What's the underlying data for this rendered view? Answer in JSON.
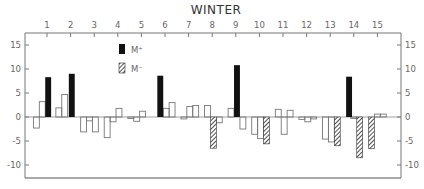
{
  "chart_data": {
    "type": "bar",
    "title": "WINTER",
    "xlabel": "",
    "ylabel": "",
    "x_ticks": [
      1,
      2,
      3,
      4,
      5,
      6,
      7,
      8,
      9,
      10,
      11,
      12,
      13,
      14,
      15
    ],
    "y_ticks": [
      15,
      10,
      5,
      0,
      -5,
      -10
    ],
    "xlim": [
      0.1,
      16.0
    ],
    "ylim": [
      -12.5,
      17.5
    ],
    "grid": false,
    "legend": {
      "position": "upper-center",
      "entries": [
        {
          "label": "M⁺",
          "style": "solid-black"
        },
        {
          "label": "M⁻",
          "style": "hatched"
        }
      ]
    },
    "series": [
      {
        "name": "open",
        "style": "outline",
        "bars": [
          {
            "x": 0.55,
            "y": -2.3
          },
          {
            "x": 0.8,
            "y": 3.2
          },
          {
            "x": 1.5,
            "y": 1.9
          },
          {
            "x": 1.75,
            "y": 4.7
          },
          {
            "x": 2.55,
            "y": -3.1
          },
          {
            "x": 2.8,
            "y": -0.8
          },
          {
            "x": 3.05,
            "y": -3.1
          },
          {
            "x": 3.55,
            "y": -4.3
          },
          {
            "x": 3.8,
            "y": -1.0
          },
          {
            "x": 4.05,
            "y": 1.8
          },
          {
            "x": 4.55,
            "y": -0.3
          },
          {
            "x": 4.8,
            "y": -0.9
          },
          {
            "x": 5.05,
            "y": 1.2
          },
          {
            "x": 6.05,
            "y": 1.8
          },
          {
            "x": 6.3,
            "y": 3.0
          },
          {
            "x": 6.8,
            "y": -0.4
          },
          {
            "x": 7.05,
            "y": 2.2
          },
          {
            "x": 7.3,
            "y": 2.4
          },
          {
            "x": 7.8,
            "y": 2.4
          },
          {
            "x": 8.3,
            "y": -1.2
          },
          {
            "x": 8.8,
            "y": 1.8
          },
          {
            "x": 9.3,
            "y": -2.5
          },
          {
            "x": 9.8,
            "y": -3.6
          },
          {
            "x": 10.05,
            "y": -4.5
          },
          {
            "x": 10.8,
            "y": 1.6
          },
          {
            "x": 11.05,
            "y": -3.6
          },
          {
            "x": 11.3,
            "y": 1.4
          },
          {
            "x": 11.8,
            "y": -0.5
          },
          {
            "x": 12.05,
            "y": -1.0
          },
          {
            "x": 12.3,
            "y": -0.4
          },
          {
            "x": 12.8,
            "y": -4.6
          },
          {
            "x": 13.05,
            "y": -5.2
          },
          {
            "x": 14.0,
            "y": -0.3
          },
          {
            "x": 15.0,
            "y": 0.6
          },
          {
            "x": 15.25,
            "y": 0.6
          }
        ]
      },
      {
        "name": "M+",
        "style": "solid-black",
        "bars": [
          {
            "x": 1.05,
            "y": 8.3
          },
          {
            "x": 2.05,
            "y": 9.0
          },
          {
            "x": 5.8,
            "y": 8.6
          },
          {
            "x": 9.05,
            "y": 10.8
          },
          {
            "x": 13.8,
            "y": 8.4
          }
        ]
      },
      {
        "name": "M-",
        "style": "hatched",
        "bars": [
          {
            "x": 8.05,
            "y": -6.5
          },
          {
            "x": 10.3,
            "y": -5.6
          },
          {
            "x": 13.3,
            "y": -6.0
          },
          {
            "x": 14.25,
            "y": -8.5
          },
          {
            "x": 14.75,
            "y": -6.6
          }
        ]
      }
    ]
  }
}
